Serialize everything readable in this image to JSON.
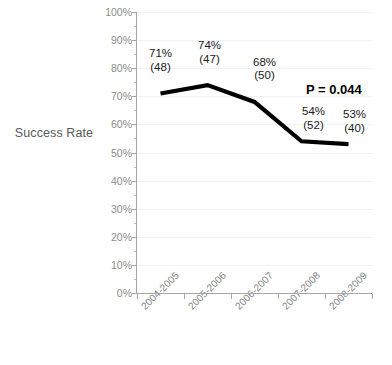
{
  "chart_data": {
    "type": "line",
    "title": "",
    "subtitle": "",
    "xlabel": "",
    "ylabel": "Success Rate",
    "categories": [
      "2004-2005",
      "2005-2006",
      "2006-2007",
      "2007-2008",
      "2008-2009"
    ],
    "values": [
      71,
      74,
      68,
      54,
      53
    ],
    "counts": [
      48,
      47,
      50,
      52,
      40
    ],
    "point_labels": [
      {
        "pct": "71%",
        "n": "(48)"
      },
      {
        "pct": "74%",
        "n": "(47)"
      },
      {
        "pct": "68%",
        "n": "(50)"
      },
      {
        "pct": "54%",
        "n": "(52)"
      },
      {
        "pct": "53%",
        "n": "(40)"
      }
    ],
    "ylim": [
      0,
      100
    ],
    "ytick_labels": [
      "100%",
      "90%",
      "80%",
      "70%",
      "60%",
      "50%",
      "40%",
      "30%",
      "20%",
      "10%",
      "0%"
    ],
    "ytick_values": [
      100,
      90,
      80,
      70,
      60,
      50,
      40,
      30,
      20,
      10,
      0
    ],
    "ytick_minor_step": 5,
    "grid": true,
    "legend": false,
    "legend_position": "none",
    "annotations": [
      {
        "name": "p-value",
        "text": "P = 0.044"
      }
    ],
    "series_color": "#000000",
    "grid_color": "#F2F2F2",
    "axis_color": "#A6A6A6",
    "tick_label_color": "#8C8C8C",
    "background": "#FFFFFF"
  }
}
